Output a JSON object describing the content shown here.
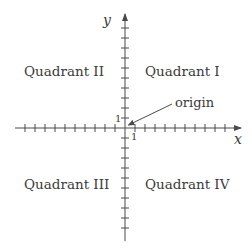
{
  "diagram": {
    "title": "",
    "axes": {
      "x_label": "x",
      "y_label": "y",
      "x_unit_label": "1",
      "y_unit_label": "1",
      "ticks_each_side": 10
    },
    "quadrants": [
      {
        "id": "I",
        "label": "Quadrant I"
      },
      {
        "id": "II",
        "label": "Quadrant II"
      },
      {
        "id": "III",
        "label": "Quadrant III"
      },
      {
        "id": "IV",
        "label": "Quadrant IV"
      }
    ],
    "annotation": {
      "label": "origin",
      "points_to": "origin"
    },
    "colors": {
      "axis": "#4a4a4a",
      "text": "#3a3a3a",
      "background": "#ffffff"
    }
  }
}
